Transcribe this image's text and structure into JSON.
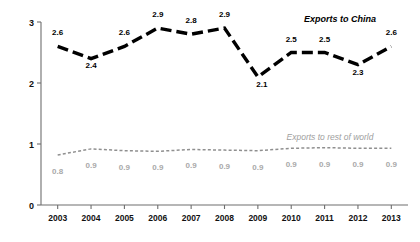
{
  "chart_data": {
    "type": "line",
    "title": "",
    "xlabel": "",
    "ylabel": "Cubic meters of H₂O per real (204) USD",
    "ylim": [
      0,
      3
    ],
    "yticks": [
      "0",
      "1",
      "2",
      "3"
    ],
    "grid": false,
    "legend_position": "inline-annotations",
    "categories": [
      "2003",
      "2004",
      "2005",
      "2006",
      "2007",
      "2008",
      "2009",
      "2010",
      "2011",
      "2012",
      "2013"
    ],
    "series": [
      {
        "name": "Exports to China",
        "style": "bold-dashed-black",
        "color": "#000000",
        "values": [
          2.6,
          2.4,
          2.6,
          2.9,
          2.8,
          2.9,
          2.1,
          2.5,
          2.5,
          2.3,
          2.6
        ],
        "labels": [
          "2.6",
          "2.4",
          "2.6",
          "2.9",
          "2.8",
          "2.9",
          "2.1",
          "2.5",
          "2.5",
          "2.3",
          "2.6"
        ]
      },
      {
        "name": "Exports to rest of world",
        "style": "fine-dotted-gray",
        "color": "#8f8f8f",
        "values": [
          0.82,
          0.92,
          0.89,
          0.88,
          0.91,
          0.9,
          0.89,
          0.93,
          0.94,
          0.93,
          0.93
        ],
        "labels": [
          "0.8",
          "0.9",
          "0.9",
          "0.9",
          "0.9",
          "0.9",
          "0.9",
          "0.9",
          "0.9",
          "0.9",
          "0.9"
        ]
      }
    ],
    "annotations": [
      {
        "text": "Exports to China",
        "series": "Exports to China"
      },
      {
        "text": "Exports to rest of world",
        "series": "Exports to rest of world"
      }
    ]
  },
  "axis": {
    "y_title": "Cubic meters of H₂O per real (204) USD",
    "y_ticks": [
      "3",
      "2",
      "1",
      "0"
    ],
    "x_ticks": [
      "2003",
      "2004",
      "2005",
      "2006",
      "2007",
      "2008",
      "2009",
      "2010",
      "2011",
      "2012",
      "2013"
    ]
  },
  "series_labels": {
    "china": "Exports to China",
    "rest_of_world": "Exports to rest of world"
  },
  "colors": {
    "china_line": "#000000",
    "row_line": "#8f8f8f",
    "row_text": "#a9a9a9",
    "axis": "#6e6e6e",
    "background": "#ffffff"
  }
}
